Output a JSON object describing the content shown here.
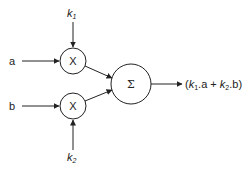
{
  "diagram": {
    "inputs": [
      {
        "id": "a",
        "label": "a"
      },
      {
        "id": "b",
        "label": "b"
      }
    ],
    "weights": [
      {
        "id": "k1",
        "label": "k",
        "sub": "1"
      },
      {
        "id": "k2",
        "label": "k",
        "sub": "2"
      }
    ],
    "nodes": {
      "mult1": {
        "symbol": "X"
      },
      "mult2": {
        "symbol": "X"
      },
      "sum": {
        "symbol": "Σ"
      }
    },
    "output": {
      "open": "(",
      "k1": "k",
      "k1_sub": "1",
      "mid1": ".a + ",
      "k2": "k",
      "k2_sub": "2",
      "end": ".b)"
    }
  }
}
